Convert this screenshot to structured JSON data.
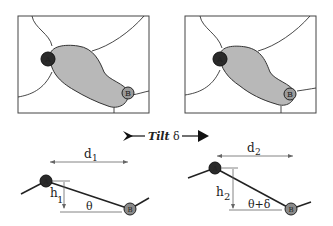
{
  "panels": [
    {
      "name": "before-tilt",
      "point_a": "A",
      "point_b": "B"
    },
    {
      "name": "after-tilt",
      "point_a": "A",
      "point_b": "B"
    }
  ],
  "tilt": {
    "label": "Tilt",
    "symbol": "δ"
  },
  "profiles": [
    {
      "distance_label": "d",
      "distance_sub": "1",
      "height_label": "h",
      "height_sub": "1",
      "angle_label": "θ",
      "point_a": "A",
      "point_b": "B"
    },
    {
      "distance_label": "d",
      "distance_sub": "2",
      "height_label": "h",
      "height_sub": "2",
      "angle_label": "θ+δ",
      "point_a": "A",
      "point_b": "B"
    }
  ],
  "colors": {
    "region_fill": "#b8b8b8",
    "point_a": "#2a2a2a",
    "point_b": "#9a9a9a",
    "stroke": "#333333"
  }
}
